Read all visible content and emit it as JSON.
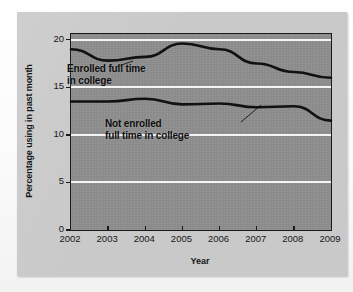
{
  "chart_data": {
    "type": "line",
    "title": "",
    "subtitle": "",
    "xlabel": "Year",
    "ylabel": "Percentage using in past month",
    "x": [
      2002,
      2003,
      2004,
      2005,
      2006,
      2007,
      2008,
      2009
    ],
    "xtick_labels": [
      "2002",
      "2003",
      "2004",
      "2005",
      "2006",
      "2007",
      "2008",
      "2009"
    ],
    "ytick_labels": [
      "0",
      "5",
      "10",
      "15",
      "20"
    ],
    "yticks": [
      0,
      5,
      10,
      15,
      20
    ],
    "ylim": [
      0,
      20.6
    ],
    "xlim": [
      2002,
      2009
    ],
    "grid": "horizontal",
    "legend_position": "inline-annotations",
    "series": [
      {
        "name": "Enrolled full time in college",
        "color": "#111111",
        "values": [
          19.0,
          17.8,
          18.2,
          19.6,
          19.0,
          17.5,
          16.6,
          16.0
        ]
      },
      {
        "name": "Not enrolled full time in college",
        "color": "#111111",
        "values": [
          13.5,
          13.5,
          13.8,
          13.2,
          13.3,
          12.9,
          13.0,
          11.5
        ]
      }
    ],
    "annotations": [
      {
        "id": "enrolled",
        "text_line1": "Enrolled full time",
        "text_line2": "in college",
        "target_series": "Enrolled full time in college"
      },
      {
        "id": "not_enrolled",
        "text_line1": "Not enrolled",
        "text_line2": "full time in college",
        "target_series": "Not enrolled full time in college"
      }
    ],
    "colors": {
      "panel_background": "#c9c9c9",
      "plot_background": "#8d8d8d",
      "gridline": "#f4f4f4",
      "axis": "#1a1a1a",
      "series_line": "#111111",
      "text": "#141414"
    }
  }
}
